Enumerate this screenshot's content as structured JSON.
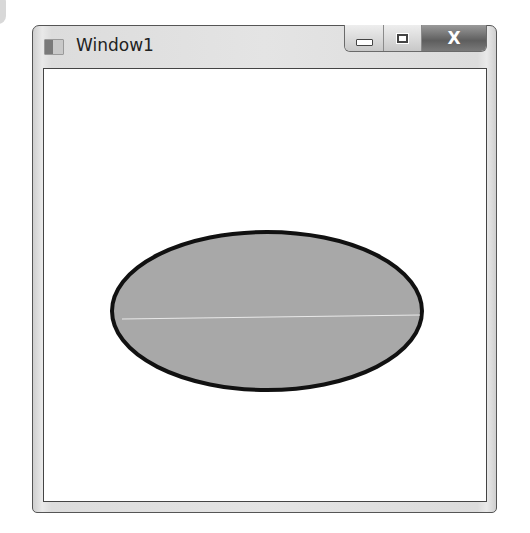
{
  "window": {
    "title": "Window1",
    "icon": "app-window-icon",
    "caption_buttons": [
      {
        "name": "minimize",
        "icon": "minimize-icon"
      },
      {
        "name": "maximize",
        "icon": "maximize-icon"
      },
      {
        "name": "close",
        "icon": "close-icon",
        "glyph": "X"
      }
    ]
  },
  "client": {
    "shape": {
      "type": "ellipse",
      "fill": "#a8a8a8",
      "stroke": "#111111",
      "stroke_width": 4
    }
  }
}
